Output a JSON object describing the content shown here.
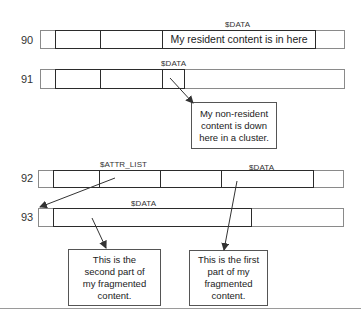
{
  "rows": [
    {
      "id": "90",
      "label": "90",
      "attributes": [
        {
          "name": "$DATA",
          "label": "$DATA",
          "content": "My resident content is in here"
        }
      ]
    },
    {
      "id": "91",
      "label": "91",
      "attributes": [
        {
          "name": "$DATA",
          "label": "$DATA"
        }
      ]
    },
    {
      "id": "92",
      "label": "92",
      "attributes": [
        {
          "name": "$ATTR_LIST",
          "label": "$ATTR_LIST"
        },
        {
          "name": "$DATA",
          "label": "$DATA"
        }
      ]
    },
    {
      "id": "93",
      "label": "93",
      "attributes": [
        {
          "name": "$DATA",
          "label": "$DATA"
        }
      ]
    }
  ],
  "callouts": {
    "nonresident": {
      "lines": [
        "My non-resident",
        "content is down",
        "here in a cluster."
      ]
    },
    "second_part": {
      "lines": [
        "This is the",
        "second part of",
        "my fragmented",
        "content."
      ]
    },
    "first_part": {
      "lines": [
        "This is the first",
        "part of my",
        "fragmented",
        "content."
      ]
    }
  },
  "colors": {
    "thick_border": "#2b2b2b",
    "outer_border": "#8a8a8a",
    "arrow": "#333333"
  }
}
